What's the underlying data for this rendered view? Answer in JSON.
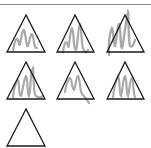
{
  "figure": {
    "colors": {
      "background": "#ffffff",
      "triangle_stroke": "#1a1a1a",
      "scribble": "#9a9a9a",
      "top_rule": "#8a8a8a"
    },
    "triangles": [
      {
        "id": 1,
        "row": 1,
        "col": 1,
        "apex": [
          26,
          15
        ],
        "base_left": [
          7,
          52
        ],
        "base_right": [
          45,
          52
        ],
        "scribbled": true
      },
      {
        "id": 2,
        "row": 1,
        "col": 2,
        "apex": [
          75,
          15
        ],
        "base_left": [
          57,
          52
        ],
        "base_right": [
          94,
          52
        ],
        "scribbled": true
      },
      {
        "id": 3,
        "row": 1,
        "col": 3,
        "apex": [
          125,
          15
        ],
        "base_left": [
          107,
          52
        ],
        "base_right": [
          144,
          52
        ],
        "scribbled": true
      },
      {
        "id": 4,
        "row": 2,
        "col": 1,
        "apex": [
          26,
          62
        ],
        "base_left": [
          7,
          99
        ],
        "base_right": [
          45,
          99
        ],
        "scribbled": true
      },
      {
        "id": 5,
        "row": 2,
        "col": 2,
        "apex": [
          75,
          62
        ],
        "base_left": [
          57,
          99
        ],
        "base_right": [
          94,
          99
        ],
        "scribbled": true
      },
      {
        "id": 6,
        "row": 2,
        "col": 3,
        "apex": [
          125,
          62
        ],
        "base_left": [
          107,
          99
        ],
        "base_right": [
          144,
          99
        ],
        "scribbled": true
      },
      {
        "id": 7,
        "row": 3,
        "col": 1,
        "apex": [
          26,
          109
        ],
        "base_left": [
          7,
          146
        ],
        "base_right": [
          45,
          146
        ],
        "scribbled": false
      }
    ]
  }
}
